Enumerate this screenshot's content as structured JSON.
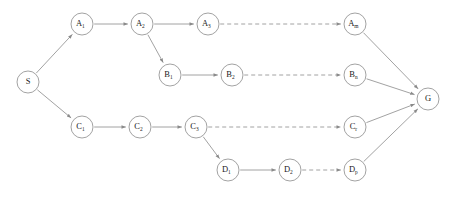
{
  "diagram": {
    "type": "directed-graph",
    "background_color": "#ffffff",
    "node_fill": "#ffffff",
    "node_stroke": "#8a8a8a",
    "label_color": "#1a1a1a",
    "node_radius": 11,
    "nodes": [
      {
        "id": "S",
        "base": "S",
        "sub": "",
        "x": 28,
        "y": 82
      },
      {
        "id": "A1",
        "base": "A",
        "sub": "1",
        "x": 82,
        "y": 24
      },
      {
        "id": "A2",
        "base": "A",
        "sub": "2",
        "x": 142,
        "y": 24
      },
      {
        "id": "A3",
        "base": "A",
        "sub": "3",
        "x": 208,
        "y": 24
      },
      {
        "id": "Am",
        "base": "A",
        "sub": "m",
        "x": 355,
        "y": 24
      },
      {
        "id": "B1",
        "base": "B",
        "sub": "1",
        "x": 170,
        "y": 75
      },
      {
        "id": "B2",
        "base": "B",
        "sub": "2",
        "x": 232,
        "y": 75
      },
      {
        "id": "Bn",
        "base": "B",
        "sub": "n",
        "x": 355,
        "y": 75
      },
      {
        "id": "C1",
        "base": "C",
        "sub": "1",
        "x": 82,
        "y": 127
      },
      {
        "id": "C2",
        "base": "C",
        "sub": "2",
        "x": 140,
        "y": 127
      },
      {
        "id": "C3",
        "base": "C",
        "sub": "3",
        "x": 196,
        "y": 127
      },
      {
        "id": "Cr",
        "base": "C",
        "sub": "r",
        "x": 355,
        "y": 127
      },
      {
        "id": "D1",
        "base": "D",
        "sub": "1",
        "x": 228,
        "y": 170
      },
      {
        "id": "D2",
        "base": "D",
        "sub": "2",
        "x": 290,
        "y": 170
      },
      {
        "id": "Dp",
        "base": "D",
        "sub": "p",
        "x": 355,
        "y": 170
      },
      {
        "id": "G",
        "base": "G",
        "sub": "",
        "x": 428,
        "y": 99
      }
    ],
    "edges": [
      {
        "from": "S",
        "to": "A1",
        "style": "solid",
        "arrow": true
      },
      {
        "from": "S",
        "to": "C1",
        "style": "solid",
        "arrow": true
      },
      {
        "from": "A1",
        "to": "A2",
        "style": "solid",
        "arrow": true
      },
      {
        "from": "A2",
        "to": "A3",
        "style": "solid",
        "arrow": true
      },
      {
        "from": "A2",
        "to": "B1",
        "style": "solid",
        "arrow": true
      },
      {
        "from": "A3",
        "to": "Am",
        "style": "dashed",
        "arrow": true
      },
      {
        "from": "B1",
        "to": "B2",
        "style": "solid",
        "arrow": true
      },
      {
        "from": "B2",
        "to": "Bn",
        "style": "dashed",
        "arrow": true
      },
      {
        "from": "C1",
        "to": "C2",
        "style": "solid",
        "arrow": true
      },
      {
        "from": "C2",
        "to": "C3",
        "style": "solid",
        "arrow": true
      },
      {
        "from": "C3",
        "to": "Cr",
        "style": "dashed",
        "arrow": true
      },
      {
        "from": "C3",
        "to": "D1",
        "style": "solid",
        "arrow": true
      },
      {
        "from": "D1",
        "to": "D2",
        "style": "solid",
        "arrow": true
      },
      {
        "from": "D2",
        "to": "Dp",
        "style": "dashed",
        "arrow": true
      },
      {
        "from": "Am",
        "to": "G",
        "style": "solid",
        "arrow": true
      },
      {
        "from": "Bn",
        "to": "G",
        "style": "solid",
        "arrow": true
      },
      {
        "from": "Cr",
        "to": "G",
        "style": "solid",
        "arrow": true
      },
      {
        "from": "Dp",
        "to": "G",
        "style": "solid",
        "arrow": true
      }
    ]
  }
}
